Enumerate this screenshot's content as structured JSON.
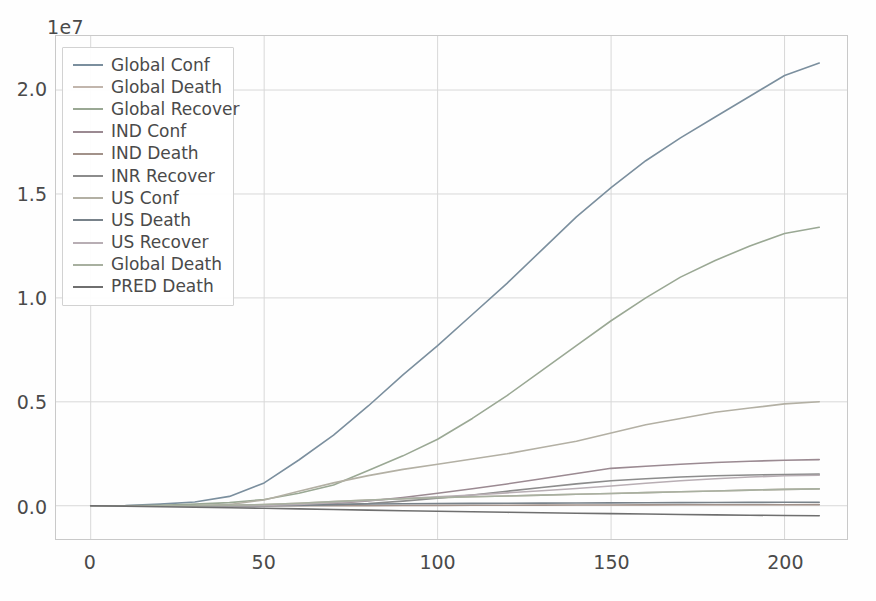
{
  "chart": {
    "type": "line",
    "offset_label": "1e7",
    "title": "",
    "xlabel": "",
    "ylabel": ""
  },
  "axes": {
    "y_ticks": [
      "0.0",
      "0.5",
      "1.0",
      "1.5",
      "2.0"
    ],
    "y_tick_values": [
      0,
      5000000,
      10000000,
      15000000,
      20000000
    ],
    "x_ticks": [
      "0",
      "50",
      "100",
      "150",
      "200"
    ],
    "x_tick_values": [
      0,
      50,
      100,
      150,
      200
    ],
    "xlim": [
      -10,
      218
    ],
    "ylim": [
      -1600000,
      22600000
    ],
    "grid": true,
    "grid_color": "#d8d8d8",
    "frame_color": "#c9c9c9"
  },
  "legend": {
    "location": "upper left",
    "frame": true,
    "entries": [
      {
        "label": "Global Conf",
        "color": "#7b8f9e"
      },
      {
        "label": "Global Death",
        "color": "#c2b6ad"
      },
      {
        "label": "Global Recover",
        "color": "#9aa894"
      },
      {
        "label": "IND Conf",
        "color": "#9b8a92"
      },
      {
        "label": "IND Death",
        "color": "#a2928a"
      },
      {
        "label": "INR Recover",
        "color": "#8c8c8c"
      },
      {
        "label": "US Conf",
        "color": "#b3b0a4"
      },
      {
        "label": "US Death",
        "color": "#78828a"
      },
      {
        "label": "US Recover",
        "color": "#b8aeb4"
      },
      {
        "label": "Global Death",
        "color": "#a8b0a0"
      },
      {
        "label": "PRED Death",
        "color": "#6f6f6f"
      }
    ]
  },
  "chart_data": {
    "type": "line",
    "title": "",
    "xlabel": "",
    "ylabel": "",
    "offset_label": "1e7",
    "xlim": [
      -10,
      218
    ],
    "ylim": [
      -1600000,
      22600000
    ],
    "grid": true,
    "legend_position": "upper left",
    "x": [
      0,
      10,
      20,
      30,
      40,
      50,
      60,
      70,
      80,
      90,
      100,
      110,
      120,
      130,
      140,
      150,
      160,
      170,
      180,
      190,
      200,
      210
    ],
    "series": [
      {
        "name": "Global Conf",
        "color": "#7b8f9e",
        "values": [
          0,
          5000,
          80000,
          180000,
          450000,
          1100000,
          2200000,
          3400000,
          4800000,
          6300000,
          7700000,
          9200000,
          10700000,
          12300000,
          13900000,
          15300000,
          16600000,
          17700000,
          18700000,
          19700000,
          20700000,
          21300000
        ]
      },
      {
        "name": "Global Death",
        "color": "#c2b6ad",
        "values": [
          0,
          200,
          2500,
          7000,
          20000,
          60000,
          120000,
          200000,
          280000,
          340000,
          390000,
          430000,
          470000,
          510000,
          550000,
          590000,
          630000,
          670000,
          710000,
          750000,
          790000,
          810000
        ]
      },
      {
        "name": "Global Recover",
        "color": "#9aa894",
        "values": [
          0,
          200,
          25000,
          80000,
          150000,
          300000,
          600000,
          1000000,
          1700000,
          2400000,
          3200000,
          4200000,
          5300000,
          6500000,
          7700000,
          8900000,
          10000000,
          11000000,
          11800000,
          12500000,
          13100000,
          13400000
        ]
      },
      {
        "name": "IND Conf",
        "color": "#9b8a92",
        "values": [
          0,
          0,
          0,
          100,
          1000,
          10000,
          40000,
          110000,
          230000,
          400000,
          600000,
          820000,
          1050000,
          1300000,
          1550000,
          1800000,
          1900000,
          2000000,
          2080000,
          2140000,
          2190000,
          2220000
        ]
      },
      {
        "name": "IND Death",
        "color": "#a2928a",
        "values": [
          0,
          0,
          0,
          0,
          30,
          300,
          1300,
          3400,
          6500,
          11000,
          17000,
          22000,
          27000,
          31000,
          35000,
          39000,
          42000,
          45000,
          47000,
          49000,
          51000,
          52000
        ]
      },
      {
        "name": "INR Recover",
        "color": "#8c8c8c",
        "values": [
          0,
          0,
          0,
          0,
          100,
          1000,
          10000,
          45000,
          110000,
          220000,
          360000,
          520000,
          700000,
          880000,
          1050000,
          1200000,
          1300000,
          1380000,
          1440000,
          1480000,
          1500000,
          1520000
        ]
      },
      {
        "name": "US Conf",
        "color": "#b3b0a4",
        "values": [
          0,
          0,
          100,
          4000,
          60000,
          280000,
          700000,
          1100000,
          1450000,
          1750000,
          2000000,
          2250000,
          2500000,
          2800000,
          3100000,
          3500000,
          3900000,
          4200000,
          4500000,
          4700000,
          4900000,
          5000000
        ]
      },
      {
        "name": "US Death",
        "color": "#78828a",
        "values": [
          0,
          0,
          0,
          100,
          900,
          8000,
          30000,
          60000,
          82000,
          95000,
          105000,
          112000,
          118000,
          124000,
          130000,
          137000,
          145000,
          152000,
          158000,
          163000,
          166000,
          168000
        ]
      },
      {
        "name": "US Recover",
        "color": "#b8aeb4",
        "values": [
          0,
          0,
          0,
          0,
          400,
          9000,
          60000,
          150000,
          250000,
          350000,
          430000,
          520000,
          620000,
          720000,
          830000,
          950000,
          1080000,
          1200000,
          1300000,
          1380000,
          1440000,
          1470000
        ]
      },
      {
        "name": "Global Death",
        "color": "#a8b0a0",
        "values": [
          0,
          200,
          2500,
          7000,
          20000,
          60000,
          120000,
          200000,
          280000,
          340000,
          390000,
          430000,
          470000,
          510000,
          550000,
          590000,
          630000,
          670000,
          710000,
          750000,
          790000,
          810000
        ]
      },
      {
        "name": "PRED Death",
        "color": "#6f6f6f",
        "values": [
          0,
          -20000,
          -45000,
          -70000,
          -95000,
          -120000,
          -150000,
          -180000,
          -210000,
          -240000,
          -265000,
          -290000,
          -315000,
          -340000,
          -360000,
          -380000,
          -400000,
          -420000,
          -440000,
          -455000,
          -470000,
          -480000
        ]
      }
    ]
  }
}
